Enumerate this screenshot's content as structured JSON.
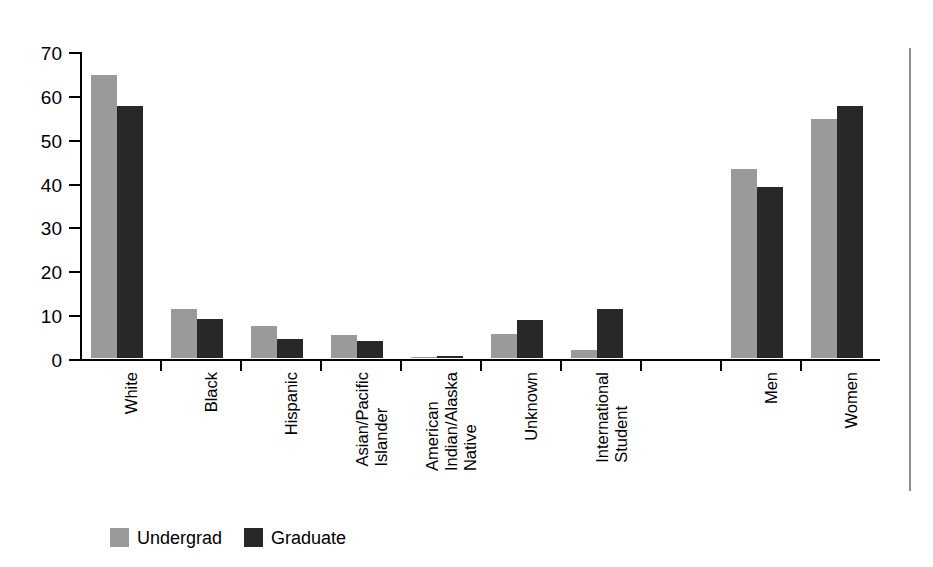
{
  "chart_data": {
    "type": "bar",
    "title": "",
    "subtitle": "",
    "xlabel": "",
    "ylabel": "",
    "ylim": [
      0,
      70
    ],
    "yticks": [
      0,
      10,
      20,
      30,
      40,
      50,
      60,
      70
    ],
    "ytick_labels": [
      "0",
      "10",
      "20",
      "30",
      "40",
      "50",
      "60",
      "70"
    ],
    "grid": false,
    "legend_position": "bottom-left",
    "categories": [
      "White",
      "Black",
      "Hispanic",
      "Asian/Pacific Islander",
      "American Indian/Alaska Native",
      "Unknown",
      "International Student",
      "Men",
      "Women"
    ],
    "category_label_lines": [
      [
        "White"
      ],
      [
        "Black"
      ],
      [
        "Hispanic"
      ],
      [
        "Asian/Pacific",
        "Islander"
      ],
      [
        "American",
        "Indian/Alaska",
        "Native"
      ],
      [
        "Unknown"
      ],
      [
        "International",
        "Student"
      ],
      [
        "Men"
      ],
      [
        "Women"
      ]
    ],
    "series": [
      {
        "name": "Undergrad",
        "color": "#9a9a9a",
        "values": [
          64.5,
          11.2,
          7.2,
          5.2,
          0.3,
          5.5,
          1.8,
          43.0,
          54.5
        ]
      },
      {
        "name": "Graduate",
        "color": "#282828",
        "values": [
          57.5,
          8.8,
          4.3,
          3.9,
          0.4,
          8.6,
          11.2,
          39.0,
          57.5
        ]
      }
    ],
    "legend": [
      "Undergrad",
      "Graduate"
    ]
  },
  "legend": {
    "items": [
      {
        "label": "Undergrad",
        "swatch": "undergrad"
      },
      {
        "label": "Graduate",
        "swatch": "graduate"
      }
    ]
  }
}
